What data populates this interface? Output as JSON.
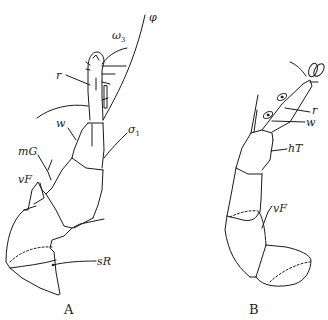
{
  "figure": {
    "panels": [
      {
        "id": "A",
        "caption": "A",
        "labels": {
          "phi": "φ",
          "omega3_base": "ω",
          "omega3_sub": "3",
          "r": "r",
          "w": "w",
          "sigma1_base": "σ",
          "sigma1_sub": "1",
          "mG": "mG",
          "vF": "vF",
          "sR": "sR"
        }
      },
      {
        "id": "B",
        "caption": "B",
        "labels": {
          "r": "r",
          "w": "w",
          "hT": "hT",
          "vF": "vF"
        }
      }
    ],
    "colors": {
      "line": "#1a1a1a",
      "background": "#ffffff"
    }
  }
}
